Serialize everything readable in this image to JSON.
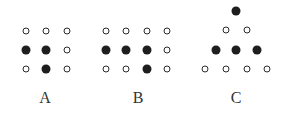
{
  "figures": [
    {
      "label": "A",
      "label_pos": [
        45,
        98
      ],
      "dots": [
        {
          "x": 26,
          "y": 31,
          "filled": false
        },
        {
          "x": 46,
          "y": 31,
          "filled": false
        },
        {
          "x": 67,
          "y": 31,
          "filled": false
        },
        {
          "x": 26,
          "y": 50,
          "filled": true
        },
        {
          "x": 46,
          "y": 50,
          "filled": true
        },
        {
          "x": 67,
          "y": 50,
          "filled": false
        },
        {
          "x": 26,
          "y": 69,
          "filled": false
        },
        {
          "x": 46,
          "y": 69,
          "filled": true
        },
        {
          "x": 67,
          "y": 69,
          "filled": false
        }
      ]
    },
    {
      "label": "B",
      "label_pos": [
        138,
        98
      ],
      "dots": [
        {
          "x": 106,
          "y": 31,
          "filled": false
        },
        {
          "x": 126,
          "y": 31,
          "filled": false
        },
        {
          "x": 147,
          "y": 31,
          "filled": false
        },
        {
          "x": 167,
          "y": 31,
          "filled": false
        },
        {
          "x": 106,
          "y": 50,
          "filled": true
        },
        {
          "x": 126,
          "y": 50,
          "filled": true
        },
        {
          "x": 147,
          "y": 50,
          "filled": true
        },
        {
          "x": 167,
          "y": 50,
          "filled": false
        },
        {
          "x": 106,
          "y": 69,
          "filled": false
        },
        {
          "x": 126,
          "y": 69,
          "filled": false
        },
        {
          "x": 147,
          "y": 69,
          "filled": true
        },
        {
          "x": 167,
          "y": 69,
          "filled": false
        }
      ]
    },
    {
      "label": "C",
      "label_pos": [
        236,
        98
      ],
      "dots": [
        {
          "x": 236,
          "y": 11,
          "filled": true
        },
        {
          "x": 226,
          "y": 30,
          "filled": false
        },
        {
          "x": 247,
          "y": 30,
          "filled": false
        },
        {
          "x": 216,
          "y": 50,
          "filled": true
        },
        {
          "x": 236,
          "y": 50,
          "filled": true
        },
        {
          "x": 257,
          "y": 50,
          "filled": true
        },
        {
          "x": 205,
          "y": 69,
          "filled": false
        },
        {
          "x": 226,
          "y": 69,
          "filled": false
        },
        {
          "x": 247,
          "y": 69,
          "filled": false
        },
        {
          "x": 267,
          "y": 69,
          "filled": false
        }
      ]
    }
  ]
}
